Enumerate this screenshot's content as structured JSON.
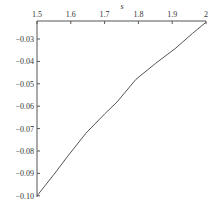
{
  "chart_data": {
    "type": "line",
    "title": "",
    "xlabel": "s",
    "ylabel": "",
    "x_axis_position": "top",
    "xlim": [
      1.5,
      2.0
    ],
    "ylim": [
      -0.1,
      -0.022
    ],
    "x_ticks": [
      "1.5",
      "1.6",
      "1.7",
      "1.8",
      "1.9",
      "2"
    ],
    "y_ticks": [
      "-0.03",
      "-0.04",
      "-0.05",
      "-0.06",
      "-0.07",
      "-0.08",
      "-0.09",
      "-0.10"
    ],
    "grid": false,
    "legend": null,
    "series": [
      {
        "name": "curve",
        "x": [
          1.5,
          1.55,
          1.589,
          1.645,
          1.7,
          1.737,
          1.793,
          1.85,
          1.911,
          1.96,
          2.0
        ],
        "y": [
          -0.1,
          -0.0905,
          -0.0827,
          -0.072,
          -0.0635,
          -0.0581,
          -0.048,
          -0.041,
          -0.034,
          -0.0275,
          -0.0225
        ]
      }
    ],
    "colors": {
      "line": "#555555",
      "axis": "#555555"
    }
  }
}
